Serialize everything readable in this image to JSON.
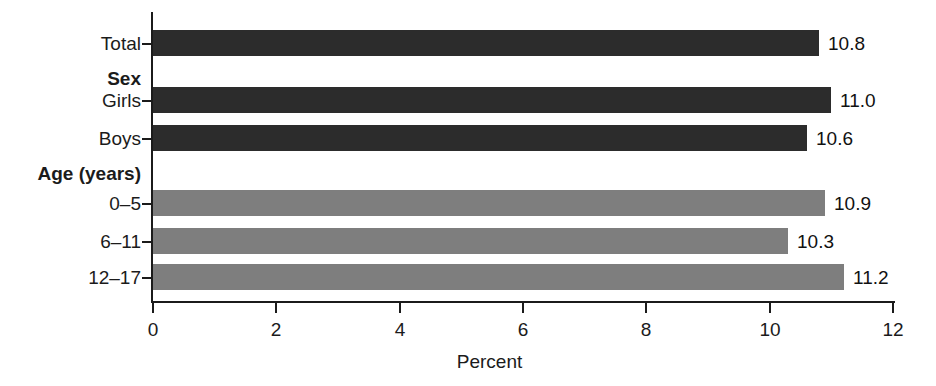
{
  "chart_data": {
    "type": "bar",
    "orientation": "horizontal",
    "title": "",
    "xlabel": "Percent",
    "ylabel": "",
    "xlim": [
      0,
      12
    ],
    "xticks": [
      0,
      2,
      4,
      6,
      8,
      10,
      12
    ],
    "xtick_labels": [
      "0",
      "2",
      "4",
      "6",
      "8",
      "10",
      "12"
    ],
    "grid": false,
    "legend": false,
    "categories": [
      "Total",
      "Girls",
      "Boys",
      "0–5",
      "6–11",
      "12–17"
    ],
    "values": [
      10.8,
      11.0,
      10.6,
      10.9,
      10.3,
      11.2
    ],
    "value_labels": [
      "10.8",
      "11.0",
      "10.6",
      "10.9",
      "10.3",
      "11.2"
    ],
    "group_headers": [
      "Sex",
      "Age (years)"
    ],
    "colors": {
      "dark_bar": "#2c2c2c",
      "light_bar": "#7e7e7e",
      "axis": "#1b1b1b",
      "background": "#ffffff",
      "text": "#1b1b1b"
    },
    "rows": [
      {
        "label": "Total",
        "value": 10.8,
        "value_label": "10.8",
        "shade": "dark",
        "kind": "bar",
        "top": 30,
        "height": 26
      },
      {
        "label": "Sex",
        "value": null,
        "value_label": "",
        "shade": "",
        "kind": "header",
        "top": 69,
        "height": 0
      },
      {
        "label": "Girls",
        "value": 11.0,
        "value_label": "11.0",
        "shade": "dark",
        "kind": "bar",
        "top": 87,
        "height": 26
      },
      {
        "label": "Boys",
        "value": 10.6,
        "value_label": "10.6",
        "shade": "dark",
        "kind": "bar",
        "top": 125,
        "height": 26
      },
      {
        "label": "Age (years)",
        "value": null,
        "value_label": "",
        "shade": "",
        "kind": "header",
        "top": 164,
        "height": 0
      },
      {
        "label": "0–5",
        "value": 10.9,
        "value_label": "10.9",
        "shade": "light",
        "kind": "bar",
        "top": 190,
        "height": 26
      },
      {
        "label": "6–11",
        "value": 10.3,
        "value_label": "10.3",
        "shade": "light",
        "kind": "bar",
        "top": 228,
        "height": 26
      },
      {
        "label": "12–17",
        "value": 11.2,
        "value_label": "11.2",
        "shade": "light",
        "kind": "bar",
        "top": 264,
        "height": 26
      }
    ]
  }
}
